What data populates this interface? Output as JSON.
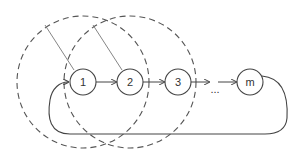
{
  "diagram": {
    "nodes": [
      {
        "id": "n1",
        "label": "1",
        "x": 83,
        "y": 82
      },
      {
        "id": "n2",
        "label": "2",
        "x": 130,
        "y": 82
      },
      {
        "id": "n3",
        "label": "3",
        "x": 178,
        "y": 82
      },
      {
        "id": "nm",
        "label": "m",
        "x": 250,
        "y": 82
      }
    ],
    "ellipsis": "...",
    "colors": {
      "stroke": "#444444",
      "dashed": "#555555",
      "radius_line": "#777777"
    }
  }
}
